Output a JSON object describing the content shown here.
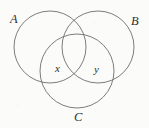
{
  "figure": {
    "kind": "venn-diagram",
    "width": 149,
    "height": 128,
    "background_color": "#fbfbfa",
    "stroke_color": "#6e6e70",
    "label_color": "#2e2e30"
  },
  "sets": [
    {
      "id": "A",
      "label": "A",
      "cx": 50,
      "cy": 47,
      "r": 36,
      "label_x": 10,
      "label_y": 13
    },
    {
      "id": "B",
      "label": "B",
      "cx": 98,
      "cy": 47,
      "r": 36,
      "label_x": 131,
      "label_y": 15
    },
    {
      "id": "C",
      "label": "C",
      "cx": 77,
      "cy": 71,
      "r": 37,
      "label_x": 74,
      "label_y": 111
    }
  ],
  "regions": [
    {
      "id": "x",
      "label": "x",
      "label_x": 55,
      "label_y": 63,
      "description": "A intersect C, outside B"
    },
    {
      "id": "y",
      "label": "y",
      "label_x": 94,
      "label_y": 64,
      "description": "B intersect C, outside A"
    }
  ]
}
